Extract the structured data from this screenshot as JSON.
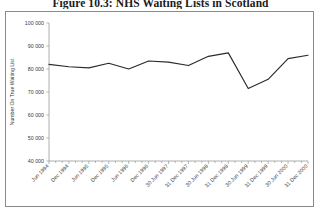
{
  "figure": {
    "title": "Figure 10.3: NHS Waiting Lists in Scotland"
  },
  "chart_data": {
    "type": "line",
    "title": "Figure 10.3: NHS Waiting Lists in Scotland",
    "xlabel": "",
    "ylabel": "Number On True Waiting List",
    "ylim": [
      40000,
      100000
    ],
    "ytick_values": [
      40000,
      50000,
      60000,
      70000,
      80000,
      90000,
      100000
    ],
    "ytick_labels": [
      "40 000",
      "50 000",
      "60 000",
      "70 000",
      "80 000",
      "90 000",
      "100 000"
    ],
    "grid": false,
    "legend": false,
    "categories": [
      "Jun 1994",
      "Dec 1994",
      "Jun 1995",
      "Dec 1995",
      "Jun 1996",
      "Dec 1996",
      "30 Jun 1997",
      "31 Dec 1997",
      "30 Jun 1998",
      "31 Dec 1998",
      "30 Jun 1999",
      "31 Dec 1999",
      "30 Jun 2000",
      "31 Dec 2000"
    ],
    "values": [
      82000,
      81000,
      80500,
      82500,
      80000,
      83500,
      83000,
      81500,
      85500,
      87000,
      71500,
      75500,
      84500,
      86000
    ],
    "minor_ticks_per_interval": 2,
    "series": [
      {
        "name": "Number On True Waiting List",
        "color": "#2b2b2b",
        "values": [
          82000,
          81000,
          80500,
          82500,
          80000,
          83500,
          83000,
          81500,
          85500,
          87000,
          71500,
          75500,
          84500,
          86000
        ]
      }
    ]
  }
}
